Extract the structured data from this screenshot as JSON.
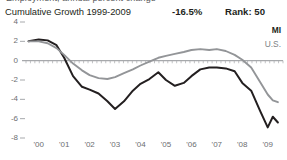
{
  "top_sliver": "Employment, annual percent change",
  "header": {
    "title": "Cumulative Growth 1999-2009",
    "value": "-16.5%",
    "rank": "Rank: 50"
  },
  "legend": {
    "series_1": "MI",
    "series_2": "U.S."
  },
  "colors": {
    "series_1": "#231f20",
    "series_2": "#939598",
    "axis": "#a7a9ac",
    "tick_text": "#6d6e71",
    "background": "#ffffff"
  },
  "chart_data": {
    "type": "line",
    "title": "Cumulative Growth 1999-2009",
    "xlabel": "",
    "ylabel": "",
    "xlim": [
      1999.5,
      2009.6
    ],
    "ylim": [
      -8,
      4
    ],
    "yticks": [
      4,
      2,
      0,
      -2,
      -4,
      -6,
      -8
    ],
    "ytick_labels": [
      "4",
      "2",
      "0",
      "-2",
      "-4",
      "-6",
      "-8"
    ],
    "xticks": [
      2000,
      2001,
      2002,
      2003,
      2004,
      2005,
      2006,
      2007,
      2008,
      2009
    ],
    "xtick_labels": [
      "'00",
      "'01",
      "'02",
      "'03",
      "'04",
      "'05",
      "'06",
      "'07",
      "'08",
      "'09"
    ],
    "grid": false,
    "zero_line": true,
    "legend_position": "top-right",
    "annotations": [
      {
        "text": "-16.5%",
        "role": "cumulative-growth-value"
      },
      {
        "text": "Rank: 50",
        "role": "state-rank"
      }
    ],
    "series": [
      {
        "name": "MI",
        "color": "#231f20",
        "x": [
          1999.6,
          2000.0,
          2000.35,
          2000.7,
          2001.0,
          2001.35,
          2001.7,
          2002.0,
          2002.35,
          2002.7,
          2003.0,
          2003.35,
          2003.7,
          2004.0,
          2004.35,
          2004.7,
          2005.0,
          2005.35,
          2005.7,
          2006.0,
          2006.35,
          2006.7,
          2007.0,
          2007.35,
          2007.7,
          2008.0,
          2008.35,
          2008.7,
          2009.0,
          2009.2,
          2009.4
        ],
        "values": [
          2.0,
          2.2,
          2.1,
          1.6,
          0.3,
          -1.6,
          -2.7,
          -3.0,
          -3.4,
          -4.2,
          -5.0,
          -4.2,
          -3.1,
          -2.4,
          -1.9,
          -1.2,
          -2.0,
          -2.6,
          -2.3,
          -1.6,
          -0.9,
          -0.7,
          -0.7,
          -0.8,
          -1.1,
          -2.3,
          -3.1,
          -5.2,
          -6.9,
          -5.8,
          -6.4
        ]
      },
      {
        "name": "U.S.",
        "color": "#939598",
        "x": [
          1999.6,
          2000.0,
          2000.35,
          2000.7,
          2001.0,
          2001.35,
          2001.7,
          2002.0,
          2002.35,
          2002.7,
          2003.0,
          2003.35,
          2003.7,
          2004.0,
          2004.35,
          2004.7,
          2005.0,
          2005.35,
          2005.7,
          2006.0,
          2006.35,
          2006.7,
          2007.0,
          2007.35,
          2007.7,
          2008.0,
          2008.35,
          2008.7,
          2009.0,
          2009.2,
          2009.4
        ],
        "values": [
          2.0,
          2.0,
          1.8,
          1.3,
          0.6,
          -0.3,
          -1.0,
          -1.5,
          -1.8,
          -1.9,
          -1.7,
          -1.3,
          -0.9,
          -0.5,
          -0.1,
          0.3,
          0.5,
          0.7,
          0.9,
          1.1,
          1.2,
          1.1,
          1.2,
          1.0,
          0.6,
          0.1,
          -0.7,
          -2.2,
          -3.5,
          -4.1,
          -4.3
        ]
      }
    ]
  }
}
